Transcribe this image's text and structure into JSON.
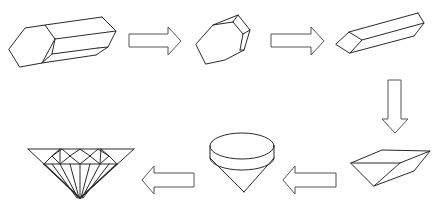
{
  "diagram": {
    "title": "Diamond cutting process from rough crystal to brilliant cut",
    "stroke_color": "#2a2a2a",
    "arrow_stroke_color": "#555555",
    "background": "#ffffff",
    "stages": [
      {
        "id": "rough-crystal",
        "label": "Rough elongated hexagonal crystal"
      },
      {
        "id": "cleaved-crystal",
        "label": "Cleaved rounded crystal"
      },
      {
        "id": "sawn-bar",
        "label": "Sawn rectangular bar"
      },
      {
        "id": "wedge-block",
        "label": "Wedge-shaped block"
      },
      {
        "id": "rounded-cone",
        "label": "Rounded girdle with cone pavilion"
      },
      {
        "id": "brilliant-cut",
        "label": "Faceted brilliant-cut diamond"
      }
    ],
    "arrows": [
      {
        "direction": "right",
        "from": "rough-crystal",
        "to": "cleaved-crystal"
      },
      {
        "direction": "right",
        "from": "cleaved-crystal",
        "to": "sawn-bar"
      },
      {
        "direction": "down",
        "from": "sawn-bar",
        "to": "wedge-block"
      },
      {
        "direction": "left",
        "from": "wedge-block",
        "to": "rounded-cone"
      },
      {
        "direction": "left",
        "from": "rounded-cone",
        "to": "brilliant-cut"
      }
    ]
  }
}
